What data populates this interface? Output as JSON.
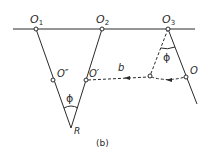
{
  "figure": {
    "caption": "(b)",
    "line_color": "#2a2a2a",
    "background": "#ffffff"
  },
  "labels": {
    "o1": "O",
    "o1_sub": "1",
    "o2": "O",
    "o2_sub": "2",
    "o3": "O",
    "o3_sub": "3",
    "o_double_prime": "O″",
    "o_prime": "O′",
    "o": "O",
    "r": "R",
    "b": "b",
    "phi_left": "ϕ",
    "phi_right": "ϕ"
  },
  "points": {
    "O1": [
      36,
      29
    ],
    "O2": [
      102,
      29
    ],
    "O3": [
      168,
      29
    ],
    "O_double_prime": [
      53,
      80
    ],
    "O_prime": [
      86,
      80
    ],
    "R": [
      71,
      128
    ],
    "P": [
      150,
      76
    ],
    "O": [
      186,
      77
    ]
  }
}
